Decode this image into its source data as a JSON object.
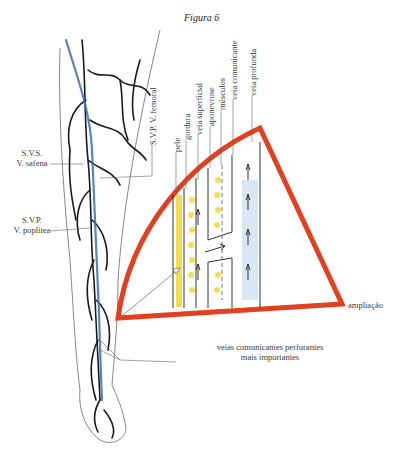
{
  "figure": {
    "title": "Figura 6",
    "labels": {
      "svp_femoral": "S.V.P. V. femoral",
      "svs": "S.V.S.",
      "safena": "V. safena",
      "svp": "S.V.P.",
      "poplitea": "V. poplítea",
      "pele": "pele",
      "gordura": "gordura",
      "veia_superficial": "veia superficial",
      "aponevrose": "aponevrose",
      "musculos": "músculos",
      "veia_comunicante": "veia comunicante",
      "veia_profunda": "veia profunda",
      "ampliacao": "ampliação",
      "perfurantes_line1": "veias comunicantes perfurantes",
      "perfurantes_line2": "mais importantes"
    },
    "colors": {
      "frame_red": "#e2401f",
      "vein_black": "#1a1a1a",
      "vein_blue": "#3a6fb5",
      "fat_yellow": "#f2d83a",
      "muscle_blue": "#cfe0f0"
    }
  }
}
